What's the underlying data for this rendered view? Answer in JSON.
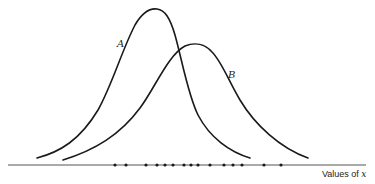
{
  "chart_data": {
    "type": "line",
    "title": "",
    "xlabel": "Values of x",
    "ylabel": "",
    "grid": false,
    "legend": "inline labels on curves",
    "series": [
      {
        "name": "A",
        "shape": "normal density",
        "relative_mean": 0.42,
        "relative_sd": 0.11,
        "relative_peak_height": 1.0
      },
      {
        "name": "B",
        "shape": "normal density",
        "relative_mean": 0.52,
        "relative_sd": 0.14,
        "relative_peak_height": 0.76
      }
    ],
    "observations_on_axis": [
      115,
      126,
      146,
      157,
      165,
      173,
      184,
      191,
      198,
      210,
      224,
      233,
      242,
      264,
      281
    ],
    "observation_count": 15
  },
  "labels": {
    "curve_a": "A",
    "curve_b": "B",
    "x_axis_prefix": "Values of ",
    "x_axis_var": "x"
  }
}
